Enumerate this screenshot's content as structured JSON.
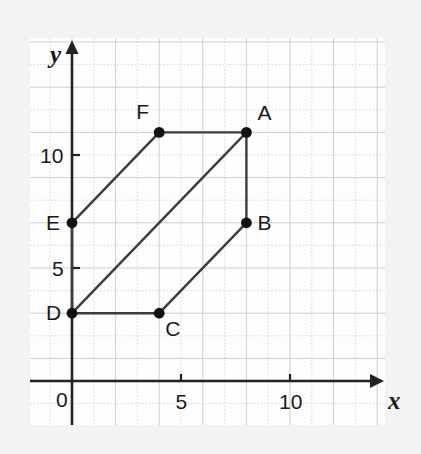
{
  "figure": {
    "background_color": "#f3f3f2",
    "plot_background_color": "#fdfdfd",
    "ink_color": "#222222",
    "grid_color": "#c9c9cc"
  },
  "axes": {
    "x_axis_name": "x",
    "y_axis_name": "y",
    "origin_label": "0",
    "x_ticks": [
      {
        "value": 5,
        "label": "5"
      },
      {
        "value": 10,
        "label": "10"
      }
    ],
    "y_ticks": [
      {
        "value": 5,
        "label": "5"
      },
      {
        "value": 10,
        "label": "10"
      }
    ]
  },
  "chart_data": {
    "type": "scatter",
    "title": "",
    "xlabel": "x",
    "ylabel": "y",
    "xlim": [
      -2,
      14
    ],
    "ylim": [
      -2,
      15
    ],
    "grid": true,
    "legend": "none",
    "shape": "hexagon",
    "points": [
      {
        "name": "A",
        "x": 8,
        "y": 11,
        "label": "A",
        "label_position": "right-above"
      },
      {
        "name": "B",
        "x": 8,
        "y": 7,
        "label": "B",
        "label_position": "right"
      },
      {
        "name": "C",
        "x": 4,
        "y": 3,
        "label": "C",
        "label_position": "right-below"
      },
      {
        "name": "D",
        "x": 0,
        "y": 3,
        "label": "D",
        "label_position": "left"
      },
      {
        "name": "E",
        "x": 0,
        "y": 7,
        "label": "E",
        "label_position": "left"
      },
      {
        "name": "F",
        "x": 4,
        "y": 11,
        "label": "F",
        "label_position": "left-above"
      }
    ],
    "edges": [
      [
        "F",
        "A"
      ],
      [
        "A",
        "B"
      ],
      [
        "B",
        "C"
      ],
      [
        "C",
        "D"
      ],
      [
        "D",
        "E"
      ],
      [
        "E",
        "F"
      ],
      [
        "D",
        "A"
      ]
    ]
  }
}
